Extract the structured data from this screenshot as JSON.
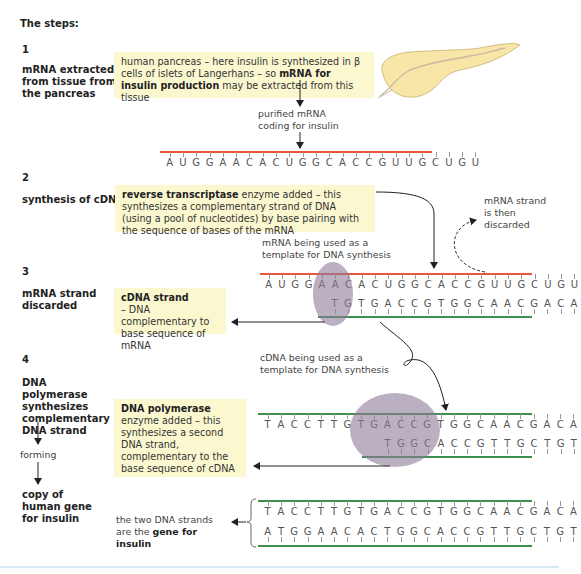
{
  "heading": "The steps:",
  "colors": {
    "mrna_backbone": "#e8553a",
    "dna_backbone": "#3f8f4f",
    "box_fill": "#fbf8d0",
    "enzyme_ellipse": "#8e7a9a",
    "pancreas_fill": "#f7e6a8",
    "footer_rule": "#d7e8f0"
  },
  "steps": [
    {
      "number": "1",
      "label": "mRNA extracted from tissue from the pancreas",
      "box": {
        "text_pre": "human pancreas – here insulin is synthesized in β cells of islets of Langerhans – so ",
        "text_bold": "mRNA for insulin production",
        "text_post": " may be extracted from this tissue"
      },
      "image": "pancreas-illustration",
      "note": "purified mRNA coding for insulin",
      "mrna_sequence": "AUGGAACACUGGCACCGUUGCUGU"
    },
    {
      "number": "2",
      "label": "synthesis of cDNA",
      "box": {
        "text_bold": "reverse transcriptase",
        "text_post": " enzyme added – this synthesizes a complementary strand of DNA (using a pool of nucleotides) by base pairing with the sequence of bases of the mRNA"
      },
      "side_note": "mRNA strand is then discarded"
    },
    {
      "number": "3",
      "label": "mRNA strand discarded",
      "template_note": "mRNA being used as a template for DNA synthesis",
      "mrna_sequence": "AUGGAACACUGGCACCGUUGCUGU",
      "cdna_sequence": "TGTGACCGTGGCAACGACA",
      "cdna_offset": 5,
      "box": {
        "title": "cDNA strand",
        "text": "– DNA complementary to base sequence of mRNA"
      }
    },
    {
      "number": "4",
      "label": "DNA polymerase synthesizes complementary DNA strand",
      "forming": "forming",
      "result": "copy of human gene for insulin",
      "template_note": "cDNA being used as a template for DNA synthesis",
      "cdna_sequence": "TACCTTGTGACCGTGGCAACGACA",
      "new_strand_sequence": "TGGCACCGTTGCTGT",
      "new_strand_offset": 9,
      "box": {
        "title": "DNA polymerase",
        "text": "enzyme added – this synthesizes a second DNA strand, complementary to the base sequence of cDNA"
      }
    }
  ],
  "final": {
    "text_pre": "the two DNA strands are the ",
    "text_bold": "gene for insulin",
    "strand_top": "TACCTTGTGACCGTGGCAACGACA",
    "strand_bottom": "ATGGAACACTGGCACCGTTGCTGT"
  }
}
